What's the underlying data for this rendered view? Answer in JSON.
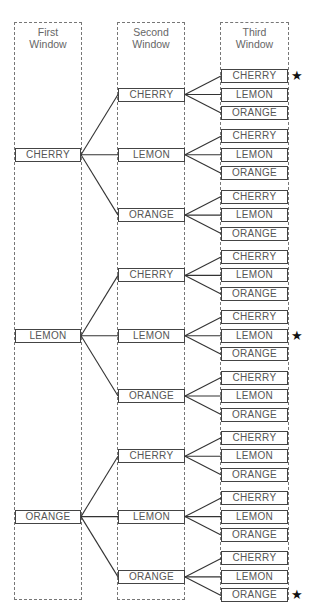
{
  "windows": [
    {
      "title_line1": "First",
      "title_line2": "Window"
    },
    {
      "title_line1": "Second",
      "title_line2": "Window"
    },
    {
      "title_line1": "Third",
      "title_line2": "Window"
    }
  ],
  "labels": [
    "CHERRY",
    "LEMON",
    "ORANGE"
  ],
  "first": [
    "CHERRY",
    "LEMON",
    "ORANGE"
  ],
  "second": [
    "CHERRY",
    "LEMON",
    "ORANGE",
    "CHERRY",
    "LEMON",
    "ORANGE",
    "CHERRY",
    "LEMON",
    "ORANGE"
  ],
  "third": [
    "CHERRY",
    "LEMON",
    "ORANGE",
    "CHERRY",
    "LEMON",
    "ORANGE",
    "CHERRY",
    "LEMON",
    "ORANGE",
    "CHERRY",
    "LEMON",
    "ORANGE",
    "CHERRY",
    "LEMON",
    "ORANGE",
    "CHERRY",
    "LEMON",
    "ORANGE",
    "CHERRY",
    "LEMON",
    "ORANGE",
    "CHERRY",
    "LEMON",
    "ORANGE",
    "CHERRY",
    "LEMON",
    "ORANGE"
  ],
  "stars": {
    "icon": "★",
    "marked_outcomes": [
      "CHERRY-CHERRY-CHERRY",
      "LEMON-LEMON-LEMON",
      "ORANGE-ORANGE-ORANGE"
    ]
  }
}
